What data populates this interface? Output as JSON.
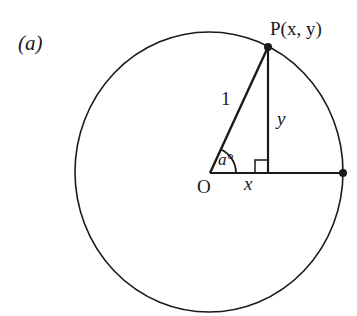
{
  "figure": {
    "part_label": "(a)",
    "point_P_label": "P(x, y)",
    "radius_label": "1",
    "opposite_label": "y",
    "adjacent_label": "x",
    "angle_label": "a°",
    "origin_label": "O"
  },
  "geometry": {
    "circle_center": [
      209,
      172
    ],
    "circle_rx": 134,
    "circle_ry": 140,
    "origin": [
      210,
      173
    ],
    "point_P": [
      268,
      47
    ],
    "foot_of_perpendicular": [
      268,
      173
    ],
    "right_intersection": [
      343,
      173
    ],
    "right_angle_marker_size": 13,
    "angle_arc_radius": 26
  },
  "colors": {
    "stroke": "#1a1a1a",
    "background": "#ffffff"
  }
}
